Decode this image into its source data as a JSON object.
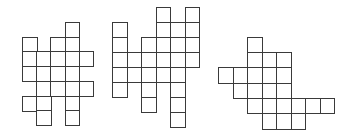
{
  "diagram": {
    "line_color": "#3a3a3a",
    "figures": [
      {
        "name": "figure-1",
        "origin": [
          22,
          22
        ],
        "cell_w": 14.2,
        "cell_h": 14.7,
        "rows": [
          [
            3
          ],
          [
            0,
            2,
            3
          ],
          [
            0,
            1,
            2,
            3,
            4
          ],
          [
            0,
            1,
            2,
            3
          ],
          [
            1,
            2,
            3,
            4
          ],
          [
            0,
            1,
            3
          ],
          [
            1,
            3
          ]
        ]
      },
      {
        "name": "figure-2",
        "origin": [
          112,
          7
        ],
        "cell_w": 14.5,
        "cell_h": 15,
        "rows": [
          [
            3,
            5
          ],
          [
            0,
            3,
            4,
            5
          ],
          [
            0,
            2,
            3,
            4,
            5
          ],
          [
            0,
            1,
            2,
            3,
            4,
            5
          ],
          [
            0,
            1,
            2,
            3,
            4
          ],
          [
            0,
            2,
            4
          ],
          [
            2,
            4
          ],
          [
            4
          ]
        ]
      },
      {
        "name": "figure-3",
        "origin": [
          218,
          37
        ],
        "cell_w": 14.5,
        "cell_h": 15.2,
        "rows": [
          [
            2
          ],
          [
            2,
            3,
            4
          ],
          [
            0,
            1,
            2,
            3,
            4
          ],
          [
            1,
            2,
            3,
            4
          ],
          [
            2,
            3,
            4,
            5,
            6,
            7
          ],
          [
            3,
            4,
            5
          ]
        ]
      }
    ]
  }
}
